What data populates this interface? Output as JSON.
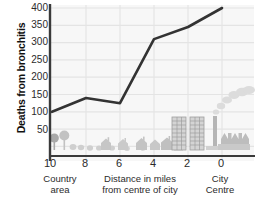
{
  "chart_data": {
    "type": "line",
    "title": "",
    "subtitle": "",
    "xlabel": "Distance in miles from centre of city",
    "ylabel": "Deaths from bronchitis",
    "x": [
      10,
      8,
      6,
      4,
      2,
      0
    ],
    "values": [
      100,
      140,
      125,
      310,
      345,
      400
    ],
    "series": [
      {
        "name": "Deaths from bronchitis",
        "values": [
          100,
          140,
          125,
          310,
          345,
          400
        ]
      }
    ],
    "categories": [
      "10",
      "8",
      "6",
      "4",
      "2",
      "0"
    ],
    "xlim": [
      10,
      0
    ],
    "ylim": [
      0,
      400
    ],
    "ytick_labels": [
      "400",
      "350",
      "300",
      "250",
      "200",
      "150",
      "100",
      "50"
    ],
    "ytick_values": [
      400,
      350,
      300,
      250,
      200,
      150,
      100,
      50
    ],
    "xtick_labels": [
      "10",
      "8",
      "6",
      "4",
      "2",
      "0"
    ],
    "grid": true,
    "legend": "none",
    "line_color": "#333333",
    "grid_color": "#e2e2e2",
    "plot_background": "#f7f7f7",
    "annotations": [
      "Country area",
      "City Centre"
    ]
  },
  "axis": {
    "y_title": "Deaths from bronchitis",
    "y_ticks": [
      "400",
      "350",
      "300",
      "250",
      "200",
      "150",
      "100",
      "50"
    ],
    "x_ticks": [
      "10",
      "8",
      "6",
      "4",
      "2",
      "0"
    ]
  },
  "captions": {
    "country_line1": "Country",
    "country_line2": "area",
    "distance_line1": "Distance in miles",
    "distance_line2": "from centre of city",
    "city_line1": "City",
    "city_line2": "Centre"
  },
  "illustration": {
    "trees": "tree-icon",
    "bushes": "bush-icon",
    "houses": "house-icon",
    "tower_blocks": "tower-block-icon",
    "factory": "factory-icon",
    "smoke": "smoke-icon"
  },
  "colors": {
    "line": "#333333",
    "grid": "#e2e2e2",
    "axis": "#3a3a3a",
    "plot_bg": "#f7f7f7",
    "illustration": "#b9b9b9",
    "illustration_dark": "#a0a0a0"
  }
}
